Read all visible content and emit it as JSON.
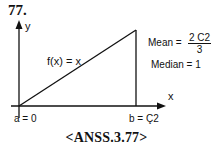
{
  "problem_number": "77.",
  "diagram": {
    "y_axis_label": "y",
    "x_axis_label": "x",
    "function_label": "f(x) = x",
    "a_label": "a = 0",
    "b_label": "b = Ç2",
    "mean_prefix": "Mean =",
    "mean_numerator": "2 C2",
    "mean_denominator": "3",
    "median_label": "Median = 1"
  },
  "caption": "<ANSS.3.77>"
}
